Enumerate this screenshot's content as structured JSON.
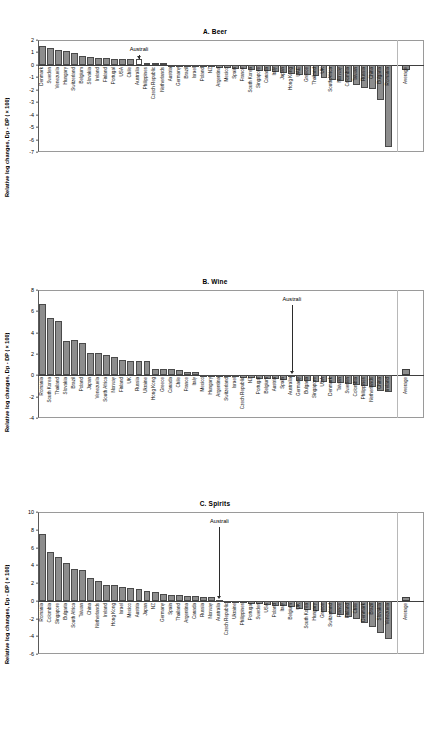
{
  "figure": {
    "ylabel": "Relative log changes, Dp - DP (×100)",
    "annotation_label": "Australi"
  },
  "chart_data": [
    {
      "type": "bar",
      "title": "A. Beer",
      "xlabel": "",
      "ylabel": "Relative log changes, Dp - DP (×100)",
      "ylim": [
        -7,
        2
      ],
      "yticks": [
        2,
        1,
        0,
        -1,
        -2,
        -3,
        -4,
        -5,
        -6,
        -7
      ],
      "grid": false,
      "legend": null,
      "highlight": "Australia",
      "annotation": "Australi",
      "average_label": "Average",
      "average_value": -0.45,
      "categories": [
        "Denmark",
        "Sweden",
        "Venezuela",
        "Hungary",
        "Switzerland",
        "Belgium",
        "Slovakia",
        "Ireland",
        "Finland",
        "Portugal",
        "USA",
        "Chile",
        "Australia",
        "Philippines",
        "Czech Republic",
        "Netherlands",
        "Austria",
        "Germany",
        "Brazil",
        "Israel",
        "Poland",
        "NZ",
        "Argentina",
        "Mexico",
        "Spain",
        "France",
        "South Korea",
        "Singapore",
        "Canada",
        "Italy",
        "Japan",
        "Hong Kong",
        "UAE",
        "Greece",
        "Thailand",
        "UK",
        "South Africa",
        "Norway",
        "Colombia",
        "Taiwan",
        "Russia",
        "China",
        "Bulgaria",
        "Romania"
      ],
      "values": [
        1.55,
        1.33,
        1.2,
        1.08,
        0.93,
        0.73,
        0.6,
        0.57,
        0.55,
        0.5,
        0.49,
        0.48,
        0.47,
        0.18,
        0.15,
        0.13,
        0.02,
        -0.05,
        -0.1,
        -0.13,
        -0.16,
        -0.2,
        -0.24,
        -0.28,
        -0.33,
        -0.37,
        -0.42,
        -0.47,
        -0.52,
        -0.58,
        -0.64,
        -0.7,
        -0.78,
        -0.85,
        -0.93,
        -1.02,
        -1.2,
        -1.3,
        -1.4,
        -1.62,
        -1.85,
        -1.95,
        -2.85,
        -6.6
      ]
    },
    {
      "type": "bar",
      "title": "B. Wine",
      "xlabel": "",
      "ylabel": "Relative log changes, Dp - DP (×100)",
      "ylim": [
        -4,
        8
      ],
      "yticks": [
        8,
        6,
        4,
        2,
        0,
        -2,
        -4
      ],
      "grid": false,
      "legend": null,
      "highlight": "Australia",
      "annotation": "Australi",
      "average_label": "Average",
      "average_value": 0.55,
      "categories": [
        "Romania",
        "South Korea",
        "Thailand",
        "Slovakia",
        "Brazil",
        "Poland",
        "Japan",
        "Venezuela",
        "South Africa",
        "Norway",
        "Finland",
        "UK",
        "Russia",
        "Ukraine",
        "Hong Kong",
        "Greece",
        "Canada",
        "Chile",
        "France",
        "Italy",
        "Mexico",
        "Hungary",
        "Argentina",
        "Switzerland",
        "Israel",
        "Czech Republic",
        "NZ",
        "Portugal",
        "Belgium",
        "Austria",
        "Spain",
        "Australia",
        "Germany",
        "Bulgaria",
        "Singapore",
        "USA",
        "Denmark",
        "Taiwan",
        "Sweden",
        "Colombia",
        "Philippines",
        "Netherlands",
        "China",
        "Ireland"
      ],
      "values": [
        6.65,
        5.33,
        5.1,
        3.25,
        3.27,
        3.05,
        2.12,
        2.08,
        1.95,
        1.75,
        1.4,
        1.35,
        1.33,
        1.3,
        0.62,
        0.6,
        0.55,
        0.5,
        0.33,
        0.3,
        0.05,
        -0.05,
        -0.1,
        -0.14,
        -0.18,
        -0.22,
        -0.26,
        -0.3,
        -0.34,
        -0.38,
        -0.42,
        -0.05,
        -0.5,
        -0.55,
        -0.6,
        -0.65,
        -0.7,
        -0.76,
        -0.82,
        -0.9,
        -1.0,
        -1.1,
        -1.45,
        -1.55
      ]
    },
    {
      "type": "bar",
      "title": "C. Spirits",
      "xlabel": "",
      "ylabel": "Relative log changes, Dp - DP (×100)",
      "ylim": [
        -6,
        10
      ],
      "yticks": [
        10,
        8,
        6,
        4,
        2,
        0,
        -2,
        -4,
        -6
      ],
      "grid": false,
      "legend": null,
      "highlight": "Australia",
      "annotation": "Australi",
      "average_label": "Average",
      "average_value": 0.4,
      "categories": [
        "Romania",
        "Colombia",
        "Singapore",
        "Bulgaria",
        "South Africa",
        "Taiwan",
        "China",
        "Netherlands",
        "Ireland",
        "Hong Kong",
        "Israel",
        "Mexico",
        "Austria",
        "Japan",
        "NZ",
        "Germany",
        "Spain",
        "Thailand",
        "Argentina",
        "Canada",
        "Russia",
        "Norway",
        "Australia",
        "Czech Republic",
        "Ukraine",
        "Philippines",
        "Portugal",
        "Sweden",
        "USA",
        "Poland",
        "Italy",
        "Belgium",
        "UK",
        "South Korea",
        "Hungary",
        "Greece",
        "Switzerland",
        "France",
        "Finland",
        "Chile",
        "Denmark",
        "Brazil",
        "Slovakia",
        "Venezuela"
      ],
      "values": [
        7.55,
        5.45,
        4.9,
        4.25,
        3.6,
        3.45,
        2.55,
        2.2,
        1.8,
        1.72,
        1.5,
        1.4,
        1.3,
        1.1,
        1.0,
        0.78,
        0.7,
        0.65,
        0.58,
        0.52,
        0.46,
        0.4,
        0.05,
        -0.1,
        -0.18,
        -0.25,
        -0.32,
        -0.4,
        -0.48,
        -0.56,
        -0.64,
        -0.75,
        -0.88,
        -1.0,
        -1.15,
        -1.3,
        -1.45,
        -1.6,
        -1.8,
        -2.05,
        -2.5,
        -2.95,
        -3.6,
        -4.3
      ]
    }
  ]
}
